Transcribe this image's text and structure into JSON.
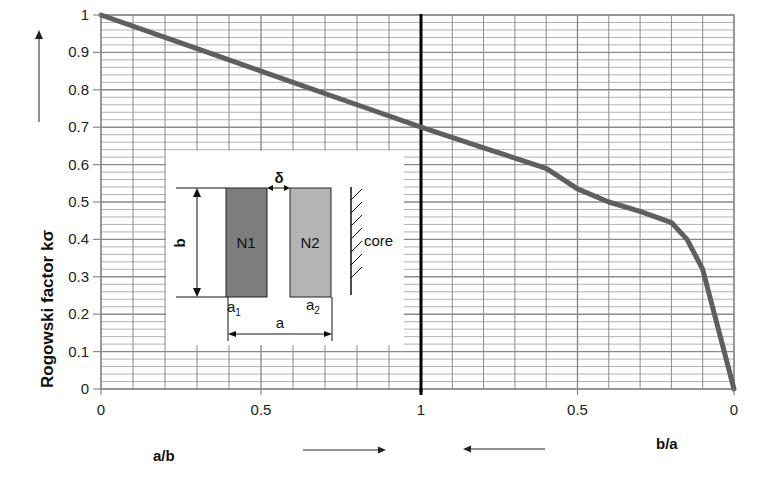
{
  "chart_data": {
    "type": "line",
    "title": "",
    "ylabel": "Rogowski factor  kσ",
    "xlabel_left": "a/b",
    "xlabel_right": "b/a",
    "ylim": [
      0,
      1
    ],
    "y_ticks": [
      "0",
      "0.1",
      "0.2",
      "0.3",
      "0.4",
      "0.5",
      "0.6",
      "0.7",
      "0.8",
      "0.9",
      "1"
    ],
    "x_ticks": [
      "0",
      "0.5",
      "1",
      "0.5",
      "0"
    ],
    "grid": true,
    "x_axis_note": "Left half: a/b from 0 to 1; right half: b/a from 1 to 0",
    "series": [
      {
        "name": "kσ vs a/b",
        "x_axis": "a/b",
        "x": [
          0,
          0.2,
          0.4,
          0.6,
          0.8,
          1.0
        ],
        "values": [
          1.0,
          0.94,
          0.88,
          0.82,
          0.76,
          0.7
        ]
      },
      {
        "name": "kσ vs b/a",
        "x_axis": "b/a",
        "x": [
          1.0,
          0.8,
          0.6,
          0.5,
          0.4,
          0.3,
          0.2,
          0.15,
          0.1,
          0.05,
          0.0
        ],
        "values": [
          0.7,
          0.645,
          0.59,
          0.535,
          0.5,
          0.475,
          0.445,
          0.4,
          0.32,
          0.16,
          0.0
        ]
      }
    ],
    "inset": {
      "labels": [
        "N1",
        "N2",
        "core",
        "b",
        "a",
        "a1",
        "a2",
        "δ"
      ],
      "description": "Two winding blocks N1 and N2 of height b, widths a1 and a2, separated by gap δ, next to the core; total width a"
    }
  },
  "labels": {
    "y_axis": "Rogowski factor  kσ",
    "x_left": "a/b",
    "x_right": "b/a",
    "inset_n1": "N1",
    "inset_n2": "N2",
    "inset_core": "core",
    "inset_b": "b",
    "inset_a": "a",
    "inset_a1": "a",
    "inset_a1_sub": "1",
    "inset_a2": "a",
    "inset_a2_sub": "2",
    "inset_delta": "δ"
  },
  "colors": {
    "curve": "#5f5f5f",
    "grid_major": "#8a8a8a",
    "grid_minor": "#a9a9a9",
    "center_line": "#000000",
    "n1_fill": "#7d7d7d",
    "n2_fill": "#b4b4b4"
  }
}
